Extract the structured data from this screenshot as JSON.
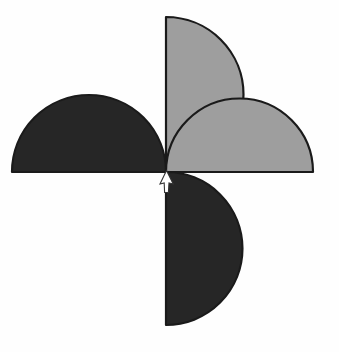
{
  "figure": {
    "canvas": {
      "width": 339,
      "height": 352
    },
    "background_color": "#fefefe"
  },
  "colors": {
    "dark_blade": "#262626",
    "light_blade": "#9e9e9e",
    "outline": "#1a1a1a",
    "background": "#fefefe",
    "cursor_fill": "#ffffff",
    "cursor_stroke": "#333333",
    "ghost_text": "#f4f4f4"
  },
  "hub": {
    "label": "centre",
    "x": 166,
    "y": 172
  },
  "blades": [
    {
      "id": "blade-top",
      "position": "top",
      "shade": "light",
      "fill": "#9e9e9e",
      "flat_edge": "vertical-left",
      "radius": 77,
      "bulge_direction": "right",
      "extent_label": "y 17 to 172"
    },
    {
      "id": "blade-left",
      "position": "left",
      "shade": "dark",
      "fill": "#262626",
      "flat_edge": "horizontal-bottom",
      "radius": 77,
      "bulge_direction": "up",
      "extent_label": "x 12 to 166"
    },
    {
      "id": "blade-right",
      "position": "right",
      "shade": "light",
      "fill": "#9e9e9e",
      "flat_edge": "horizontal-top",
      "radius": 74,
      "bulge_direction": "down",
      "extent_label": "x 166 to 313"
    },
    {
      "id": "blade-bottom",
      "position": "bottom",
      "shade": "dark",
      "fill": "#262626",
      "flat_edge": "vertical-right",
      "radius": 76,
      "bulge_direction": "left",
      "extent_label": "y 172 to 325"
    }
  ],
  "cursor": {
    "id": "mouse-cursor",
    "shape": "arrow",
    "direction": "up",
    "x": 166,
    "y": 172,
    "width": 13,
    "height": 23
  },
  "ghost_marks": [
    {
      "text": "",
      "x": 55,
      "y": 52,
      "size": 17
    },
    {
      "text": "",
      "x": 200,
      "y": 100,
      "size": 20
    },
    {
      "text": "",
      "x": 30,
      "y": 200,
      "size": 22
    },
    {
      "text": "",
      "x": 175,
      "y": 245,
      "size": 19
    },
    {
      "text": "",
      "x": 215,
      "y": 300,
      "size": 16
    }
  ]
}
